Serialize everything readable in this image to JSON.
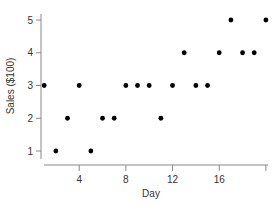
{
  "chart_data": {
    "type": "scatter",
    "title": "",
    "xlabel": "Day",
    "ylabel": "Sales ($100)",
    "xlim": [
      0,
      20
    ],
    "ylim": [
      0.6,
      5.2
    ],
    "xticks": [
      4,
      8,
      12,
      16,
      20
    ],
    "xtick_labels": [
      "4",
      "8",
      "12",
      "16",
      ""
    ],
    "yticks": [
      1,
      2,
      3,
      4,
      5
    ],
    "ytick_labels": [
      "1",
      "2",
      "3",
      "4",
      "5"
    ],
    "grid": false,
    "legend": null,
    "series": [
      {
        "name": "Sales",
        "x": [
          1,
          2,
          3,
          4,
          5,
          6,
          7,
          8,
          9,
          10,
          11,
          12,
          13,
          14,
          15,
          16,
          17,
          18,
          19,
          20
        ],
        "y": [
          3,
          1,
          2,
          3,
          1,
          2,
          2,
          3,
          3,
          3,
          2,
          3,
          4,
          3,
          3,
          4,
          5,
          4,
          4,
          5
        ]
      }
    ],
    "colors": {
      "marker": "#000000",
      "axis": "#888888",
      "text": "#333333"
    }
  }
}
